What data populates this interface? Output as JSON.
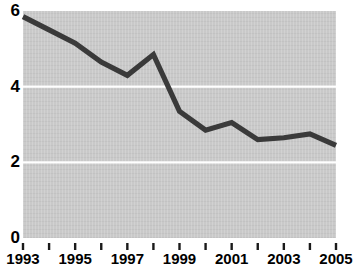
{
  "chart_data": {
    "type": "line",
    "title": "",
    "subtitle": "",
    "xlabel": "",
    "ylabel": "",
    "x": [
      1993,
      1994,
      1995,
      1996,
      1997,
      1998,
      1999,
      2000,
      2001,
      2002,
      2003,
      2004,
      2005
    ],
    "values": [
      5.85,
      5.5,
      5.15,
      4.65,
      4.3,
      4.85,
      3.35,
      2.85,
      3.05,
      2.6,
      2.65,
      2.75,
      2.45
    ],
    "series": [
      {
        "name": "",
        "values": [
          5.85,
          5.5,
          5.15,
          4.65,
          4.3,
          4.85,
          3.35,
          2.85,
          3.05,
          2.6,
          2.65,
          2.75,
          2.45
        ]
      }
    ],
    "xlim": [
      1993,
      2005
    ],
    "ylim": [
      0,
      6
    ],
    "y_ticks": [
      0,
      2,
      4,
      6
    ],
    "y_tick_labels": [
      "0",
      "2",
      "4",
      "6"
    ],
    "x_ticks": [
      1993,
      1994,
      1995,
      1996,
      1997,
      1998,
      1999,
      2000,
      2001,
      2002,
      2003,
      2004,
      2005
    ],
    "x_tick_labels": [
      "1993",
      "",
      "1995",
      "",
      "1997",
      "",
      "1999",
      "",
      "2001",
      "",
      "2003",
      "",
      "2005"
    ],
    "x_labels_shown": [
      "1993",
      "1995",
      "1997",
      "1999",
      "2001",
      "2003",
      "2005"
    ],
    "gridlines": {
      "horizontal": [
        2,
        4
      ],
      "vertical": [],
      "color": "#ffffff"
    },
    "legend": {
      "visible": false,
      "position": "none",
      "entries": []
    },
    "annotations": [],
    "colors": {
      "line": "#3a3a3a",
      "plot_background": "#c9c9c9",
      "figure_background": "#ffffff",
      "gridline": "#ffffff",
      "axis_text": "#000000"
    }
  }
}
